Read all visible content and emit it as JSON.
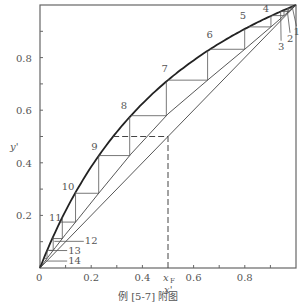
{
  "chart_data": {
    "type": "line",
    "title": "",
    "caption": "例 [5-7] 附图",
    "xlabel": "x'",
    "ylabel": "y'",
    "xlim": [
      0,
      1
    ],
    "ylim": [
      0,
      1
    ],
    "x_ticks": [
      {
        "value": 0,
        "label": "0"
      },
      {
        "value": 0.1,
        "label": ""
      },
      {
        "value": 0.2,
        "label": "0.2"
      },
      {
        "value": 0.3,
        "label": ""
      },
      {
        "value": 0.4,
        "label": "0.4"
      },
      {
        "value": 0.6,
        "label": "0.6"
      },
      {
        "value": 0.7,
        "label": ""
      },
      {
        "value": 0.8,
        "label": "0.8"
      },
      {
        "value": 0.9,
        "label": ""
      }
    ],
    "y_ticks": [
      {
        "value": 0.1,
        "label": ""
      },
      {
        "value": 0.2,
        "label": "0.2"
      },
      {
        "value": 0.3,
        "label": ""
      },
      {
        "value": 0.4,
        "label": "0.4"
      },
      {
        "value": 0.5,
        "label": ""
      },
      {
        "value": 0.6,
        "label": "0.6"
      },
      {
        "value": 0.7,
        "label": ""
      },
      {
        "value": 0.8,
        "label": "0.8"
      },
      {
        "value": 0.9,
        "label": ""
      }
    ],
    "feed": {
      "label": "x",
      "subscript": "F",
      "x": 0.5,
      "y": 0.5
    },
    "equilibrium_curve": {
      "relative_volatility": 2.5,
      "x": [
        0,
        0.02,
        0.04,
        0.06,
        0.08,
        0.1,
        0.15,
        0.2,
        0.25,
        0.3,
        0.35,
        0.4,
        0.45,
        0.5,
        0.55,
        0.6,
        0.65,
        0.7,
        0.75,
        0.8,
        0.85,
        0.9,
        0.95,
        1.0
      ]
    },
    "diagonal": {
      "x": [
        0,
        1
      ],
      "y": [
        0,
        1
      ]
    },
    "operating_line": {
      "x": [
        0,
        0.03,
        0.06,
        0.1,
        0.15,
        0.23,
        0.355,
        0.5,
        0.664,
        0.8,
        0.9,
        0.95,
        1.0
      ],
      "y": [
        0,
        0.04,
        0.078,
        0.128,
        0.188,
        0.285,
        0.433,
        0.586,
        0.722,
        0.832,
        0.915,
        0.957,
        1.0
      ]
    },
    "stages": [
      {
        "n": 1,
        "label": "1",
        "x": 0.985,
        "label_x": 0.99,
        "label_y": 0.885
      },
      {
        "n": 2,
        "label": "2",
        "x": 0.965,
        "label_x": 0.965,
        "label_y": 0.86
      },
      {
        "n": 3,
        "label": "3",
        "x": 0.94,
        "label_x": 0.93,
        "label_y": 0.83
      },
      {
        "n": 4,
        "label": "4",
        "x": 0.905,
        "label_x": 0.87,
        "label_y": 0.975
      },
      {
        "n": 5,
        "label": "5",
        "x": 0.815,
        "label_x": 0.78,
        "label_y": 0.945
      },
      {
        "n": 6,
        "label": "6",
        "x": 0.664,
        "label_x": 0.65,
        "label_y": 0.875
      },
      {
        "n": 7,
        "label": "7",
        "x": 0.5,
        "label_x": 0.475,
        "label_y": 0.745
      },
      {
        "n": 8,
        "label": "8",
        "x": 0.355,
        "label_x": 0.315,
        "label_y": 0.605
      },
      {
        "n": 9,
        "label": "9",
        "x": 0.23,
        "label_x": 0.2,
        "label_y": 0.45
      },
      {
        "n": 10,
        "label": "10",
        "x": 0.137,
        "label_x": 0.085,
        "label_y": 0.295
      },
      {
        "n": 11,
        "label": "11",
        "x": 0.078,
        "label_x": 0.035,
        "label_y": 0.18
      },
      {
        "n": 12,
        "label": "12",
        "x": 0.048,
        "label_x": 0.175,
        "label_y": 0.09
      },
      {
        "n": 13,
        "label": "13",
        "x": 0.028,
        "label_x": 0.11,
        "label_y": 0.055
      },
      {
        "n": 14,
        "label": "14",
        "x": 0.015,
        "label_x": 0.11,
        "label_y": 0.015
      }
    ],
    "grid": false,
    "legend": null
  }
}
